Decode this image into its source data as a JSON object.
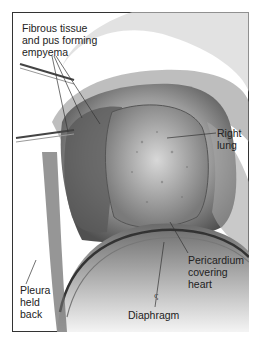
{
  "figure": {
    "labels": {
      "fibrous": "Fibrous tissue\nand pus forming\nempyema",
      "right_lung": "Right\nlung",
      "pericardium": "Pericardium\ncovering\nheart",
      "pleura": "Pleura\nheld\nback",
      "diaphragm": "Diaphragm"
    }
  }
}
